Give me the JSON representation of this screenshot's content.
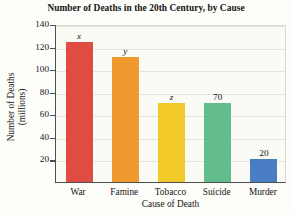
{
  "chart_data": {
    "type": "bar",
    "title": "Number of Deaths in the 20th Century, by Cause",
    "xlabel": "Cause of Death",
    "ylabel_line1": "Number of Deaths",
    "ylabel_line2": "(millions)",
    "categories": [
      "War",
      "Famine",
      "Tobacco",
      "Suicide",
      "Murder"
    ],
    "values": [
      124,
      111,
      70,
      70,
      20
    ],
    "data_labels": [
      "x",
      "y",
      "z",
      "70",
      "20"
    ],
    "data_label_styles": [
      "italic",
      "italic",
      "italic",
      "normal",
      "normal"
    ],
    "colors": [
      "#e04b42",
      "#f0992e",
      "#f2ca2a",
      "#63bc8e",
      "#4a7ec4"
    ],
    "ylim": [
      0,
      140
    ],
    "yticks": [
      20,
      40,
      60,
      80,
      100,
      120,
      140
    ],
    "ytick_labels": [
      "20",
      "40",
      "60",
      "80",
      "100",
      "120",
      "140"
    ],
    "grid": true,
    "legend": "none"
  }
}
